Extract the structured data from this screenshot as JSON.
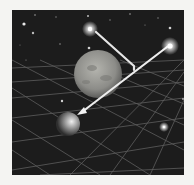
{
  "figure": {
    "colors": {
      "page_background": "#f4f4f2",
      "space": "#1c1c1c",
      "grid": "#6a6a6a",
      "star": "#ffffff",
      "ray": "#e6e6e6",
      "large_planet": "#9a9a96",
      "small_planet": "#bdbdbd"
    },
    "labels": {
      "star_b": "B",
      "planet_a": "A",
      "star_d": "D",
      "planet_c": "C"
    },
    "objects": [
      {
        "name": "star-b",
        "type": "star",
        "x": 90,
        "y": 29
      },
      {
        "name": "star-d",
        "type": "star",
        "x": 170,
        "y": 46
      },
      {
        "name": "large-planet-a",
        "type": "planet",
        "x": 98,
        "y": 74,
        "r": 24
      },
      {
        "name": "small-planet-c",
        "type": "planet",
        "x": 68,
        "y": 124,
        "r": 12
      },
      {
        "name": "star-lower-right",
        "type": "star",
        "x": 164,
        "y": 127
      }
    ]
  }
}
